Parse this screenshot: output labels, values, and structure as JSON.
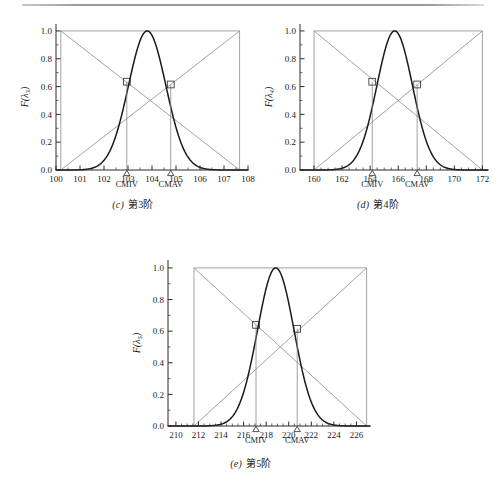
{
  "figure": {
    "background": "#ffffff",
    "top_rule_color": "#9a9a9a",
    "curve_color": "#1a1a1a",
    "helper_line_color": "#8a8a8a",
    "axis_color": "#2a2a2a"
  },
  "panels": [
    {
      "id": "panel-c",
      "caption_index": "(c)",
      "caption_text": "第3阶",
      "ylabel": "F(λ₃)",
      "xaxis": {
        "min": 100,
        "max": 108,
        "ticks": [
          100,
          101,
          102,
          103,
          104,
          105,
          106,
          107,
          108
        ],
        "tick_labels": [
          "100",
          "101",
          "102",
          "103",
          "104",
          "105",
          "106",
          "107",
          "108"
        ],
        "minor_per_interval": 2
      },
      "yaxis": {
        "min": 0.0,
        "max": 1.05,
        "ticks": [
          0.0,
          0.2,
          0.4,
          0.6,
          0.8,
          1.0
        ],
        "tick_labels": [
          "0.0",
          "0.2",
          "0.4",
          "0.6",
          "0.8",
          "1.0"
        ],
        "minor_per_interval": 2
      },
      "bounds": {
        "left": 100.2,
        "right": 107.65
      },
      "curve": {
        "type": "gaussian",
        "mean": 103.8,
        "sigma": 0.78,
        "peak": 1.0
      },
      "markers": [
        {
          "name": "CMIV",
          "x": 102.95,
          "y": 0.635,
          "label": "CMIV"
        },
        {
          "name": "CMAV",
          "x": 104.78,
          "y": 0.615,
          "label": "CMAV"
        }
      ],
      "top_line_y": 1.0,
      "diagonals": [
        {
          "from_x": 100.2,
          "from_y": 1.0,
          "to_x": 107.65,
          "to_y": 0.0
        },
        {
          "from_x": 100.2,
          "from_y": 0.0,
          "to_x": 107.65,
          "to_y": 1.0
        }
      ]
    },
    {
      "id": "panel-d",
      "caption_index": "(d)",
      "caption_text": "第4阶",
      "ylabel": "F(λ₄)",
      "xaxis": {
        "min": 159,
        "max": 172.4,
        "ticks": [
          160,
          162,
          164,
          166,
          168,
          170,
          172
        ],
        "tick_labels": [
          "160",
          "162",
          "164",
          "166",
          "168",
          "170",
          "172"
        ],
        "minor_per_interval": 4
      },
      "yaxis": {
        "min": 0.0,
        "max": 1.05,
        "ticks": [
          0.0,
          0.2,
          0.4,
          0.6,
          0.8,
          1.0
        ],
        "tick_labels": [
          "0.0",
          "0.2",
          "0.4",
          "0.6",
          "0.8",
          "1.0"
        ],
        "minor_per_interval": 2
      },
      "bounds": {
        "left": 160.0,
        "right": 172.0
      },
      "curve": {
        "type": "gaussian",
        "mean": 165.75,
        "sigma": 1.27,
        "peak": 1.0
      },
      "markers": [
        {
          "name": "CMIV",
          "x": 164.15,
          "y": 0.635,
          "label": "CMIV"
        },
        {
          "name": "CMAV",
          "x": 167.35,
          "y": 0.615,
          "label": "CMAV"
        }
      ],
      "top_line_y": 1.0,
      "diagonals": [
        {
          "from_x": 160.0,
          "from_y": 1.0,
          "to_x": 172.0,
          "to_y": 0.0
        },
        {
          "from_x": 160.0,
          "from_y": 0.0,
          "to_x": 172.0,
          "to_y": 1.0
        }
      ]
    },
    {
      "id": "panel-e",
      "caption_index": "(e)",
      "caption_text": "第5阶",
      "ylabel": "F(λ₅)",
      "xaxis": {
        "min": 209.3,
        "max": 227.2,
        "ticks": [
          210,
          212,
          214,
          216,
          218,
          220,
          222,
          224,
          226
        ],
        "tick_labels": [
          "210",
          "212",
          "214",
          "216",
          "218",
          "220",
          "222",
          "224",
          "226"
        ],
        "minor_per_interval": 4
      },
      "yaxis": {
        "min": 0.0,
        "max": 1.05,
        "ticks": [
          0.0,
          0.2,
          0.4,
          0.6,
          0.8,
          1.0
        ],
        "tick_labels": [
          "0.0",
          "0.2",
          "0.4",
          "0.6",
          "0.8",
          "1.0"
        ],
        "minor_per_interval": 2
      },
      "bounds": {
        "left": 211.6,
        "right": 226.9
      },
      "curve": {
        "type": "gaussian",
        "mean": 218.85,
        "sigma": 1.62,
        "peak": 1.0
      },
      "markers": [
        {
          "name": "CMIV",
          "x": 217.1,
          "y": 0.64,
          "label": "CMIV"
        },
        {
          "name": "CMAV",
          "x": 220.75,
          "y": 0.615,
          "label": "CMAV"
        }
      ],
      "top_line_y": 1.0,
      "diagonals": [
        {
          "from_x": 211.6,
          "from_y": 1.0,
          "to_x": 226.9,
          "to_y": 0.0
        },
        {
          "from_x": 211.6,
          "from_y": 0.0,
          "to_x": 226.9,
          "to_y": 1.0
        }
      ]
    }
  ],
  "chart_data": [
    {
      "type": "line",
      "title": "(c) 第3阶",
      "xlabel": "",
      "ylabel": "F(λ₃)",
      "xlim": [
        100,
        108
      ],
      "ylim": [
        0.0,
        1.0
      ],
      "grid": false,
      "legend": "none",
      "series": [
        {
          "name": "membership-curve",
          "distribution": "gaussian",
          "mean": 103.8,
          "sigma": 0.78,
          "peak": 1.0
        },
        {
          "name": "falling-diagonal",
          "x": [
            100.2,
            107.65
          ],
          "values": [
            1.0,
            0.0
          ]
        },
        {
          "name": "rising-diagonal",
          "x": [
            100.2,
            107.65
          ],
          "values": [
            0.0,
            1.0
          ]
        }
      ],
      "annotations": [
        {
          "label": "CMIV",
          "x": 102.95,
          "y": 0.635
        },
        {
          "label": "CMAV",
          "x": 104.78,
          "y": 0.615
        }
      ],
      "xticks": [
        100,
        101,
        102,
        103,
        104,
        105,
        106,
        107,
        108
      ],
      "yticks": [
        0.0,
        0.2,
        0.4,
        0.6,
        0.8,
        1.0
      ]
    },
    {
      "type": "line",
      "title": "(d) 第4阶",
      "xlabel": "",
      "ylabel": "F(λ₄)",
      "xlim": [
        159,
        172.4
      ],
      "ylim": [
        0.0,
        1.0
      ],
      "grid": false,
      "legend": "none",
      "series": [
        {
          "name": "membership-curve",
          "distribution": "gaussian",
          "mean": 165.75,
          "sigma": 1.27,
          "peak": 1.0
        },
        {
          "name": "falling-diagonal",
          "x": [
            160.0,
            172.0
          ],
          "values": [
            1.0,
            0.0
          ]
        },
        {
          "name": "rising-diagonal",
          "x": [
            160.0,
            172.0
          ],
          "values": [
            0.0,
            1.0
          ]
        }
      ],
      "annotations": [
        {
          "label": "CMIV",
          "x": 164.15,
          "y": 0.635
        },
        {
          "label": "CMAV",
          "x": 167.35,
          "y": 0.615
        }
      ],
      "xticks": [
        160,
        162,
        164,
        166,
        168,
        170,
        172
      ],
      "yticks": [
        0.0,
        0.2,
        0.4,
        0.6,
        0.8,
        1.0
      ]
    },
    {
      "type": "line",
      "title": "(e) 第5阶",
      "xlabel": "",
      "ylabel": "F(λ₅)",
      "xlim": [
        209.3,
        227.2
      ],
      "ylim": [
        0.0,
        1.0
      ],
      "grid": false,
      "legend": "none",
      "series": [
        {
          "name": "membership-curve",
          "distribution": "gaussian",
          "mean": 218.85,
          "sigma": 1.62,
          "peak": 1.0
        },
        {
          "name": "falling-diagonal",
          "x": [
            211.6,
            226.9
          ],
          "values": [
            1.0,
            0.0
          ]
        },
        {
          "name": "rising-diagonal",
          "x": [
            211.6,
            226.9
          ],
          "values": [
            0.0,
            1.0
          ]
        }
      ],
      "annotations": [
        {
          "label": "CMIV",
          "x": 217.1,
          "y": 0.64
        },
        {
          "label": "CMAV",
          "x": 220.75,
          "y": 0.615
        }
      ],
      "xticks": [
        210,
        212,
        214,
        216,
        218,
        220,
        222,
        224,
        226
      ],
      "yticks": [
        0.0,
        0.2,
        0.4,
        0.6,
        0.8,
        1.0
      ]
    }
  ]
}
